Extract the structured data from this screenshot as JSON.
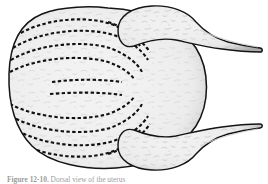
{
  "figure": {
    "caption_label": "Figure 12-10.",
    "caption_text": "Dorsal view of the uterus",
    "caption_full": "Figure 12-10. Dorsal view of the uterus",
    "alt": "Line drawing of a bicornuate uterus seen from the dorsal aspect, with dashed lines indicating myometrial fibre direction",
    "colors": {
      "outline": "#1a1a1a",
      "fill": "#f1f1f1",
      "fill_shadow": "#e2e2e2",
      "dashed_line": "#111111",
      "texture": "#b9b9b9",
      "background": "#ffffff"
    }
  },
  "diagram": {
    "title": "Dorsal view of the uterus",
    "type": "anatomical-line-drawing",
    "view": "dorsal",
    "parts": [
      {
        "id": "uterine-body",
        "label": "Uterine body",
        "side": "center"
      },
      {
        "id": "uterine-horn-upper",
        "label": "Uterine horn",
        "side": "upper-right"
      },
      {
        "id": "uterine-horn-lower",
        "label": "Uterine horn",
        "side": "lower-right"
      },
      {
        "id": "oviduct-upper",
        "label": "Oviduct",
        "side": "upper-right"
      },
      {
        "id": "oviduct-lower",
        "label": "Oviduct",
        "side": "lower-right"
      },
      {
        "id": "cervix",
        "label": "Cervix",
        "side": "left"
      }
    ],
    "annotations": {
      "dashed_lines_meaning": "muscle fibre direction",
      "dashed_line_count_upper": 5,
      "dashed_line_count_lower": 5,
      "dashed_line_count_midline": 2
    }
  }
}
